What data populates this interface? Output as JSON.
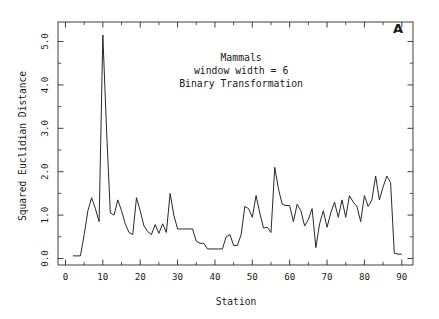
{
  "figure": {
    "panel_label": "A",
    "background_color": "#ffffff",
    "line_color": "#1c1c1c",
    "axis_color": "#2b2b2b"
  },
  "annotation": {
    "line1": "Mammals",
    "line2": "window width = 6",
    "line3": "Binary Transformation"
  },
  "chart_data": {
    "type": "line",
    "title": "",
    "subtitle": "",
    "xlabel": "Station",
    "ylabel": "Squared Euclidian Distance",
    "xlim": [
      -2,
      93
    ],
    "ylim": [
      -0.15,
      5.45
    ],
    "xticks": [
      0,
      10,
      20,
      30,
      40,
      50,
      60,
      70,
      80,
      90
    ],
    "xticklabels": [
      "0",
      "10",
      "20",
      "30",
      "40",
      "50",
      "60",
      "70",
      "80",
      "90"
    ],
    "x_minor_tick_step": 5,
    "yticks": [
      0.0,
      1.0,
      2.0,
      3.0,
      4.0,
      5.0
    ],
    "yticklabels": [
      "0.0",
      "1.0",
      "2.0",
      "3.0",
      "4.0",
      "5.0"
    ],
    "y_minor_tick_step": 0.5,
    "grid": false,
    "legend": false,
    "frame": "full-box",
    "annotations": [
      {
        "text": "Mammals",
        "x": 47,
        "y": 4.55
      },
      {
        "text": "window width = 6",
        "x": 47,
        "y": 4.25
      },
      {
        "text": "Binary Transformation",
        "x": 47,
        "y": 3.95
      },
      {
        "text": "A",
        "x": 89,
        "y": 5.2
      }
    ],
    "series": [
      {
        "name": "Squared Euclidian Distance",
        "x": [
          2,
          3,
          4,
          5,
          6,
          7,
          8,
          9,
          10,
          11,
          12,
          13,
          14,
          15,
          16,
          17,
          18,
          19,
          20,
          21,
          22,
          23,
          24,
          25,
          26,
          27,
          28,
          29,
          30,
          31,
          32,
          33,
          34,
          35,
          36,
          37,
          38,
          39,
          40,
          41,
          42,
          43,
          44,
          45,
          46,
          47,
          48,
          49,
          50,
          51,
          52,
          53,
          54,
          55,
          56,
          57,
          58,
          59,
          60,
          61,
          62,
          63,
          64,
          65,
          66,
          67,
          68,
          69,
          70,
          71,
          72,
          73,
          74,
          75,
          76,
          77,
          78,
          79,
          80,
          81,
          82,
          83,
          84,
          85,
          86,
          87,
          88,
          89,
          90
        ],
        "y": [
          0.06,
          0.06,
          0.06,
          0.55,
          1.1,
          1.4,
          1.15,
          0.85,
          5.15,
          2.95,
          1.05,
          1.0,
          1.35,
          1.1,
          0.8,
          0.6,
          0.55,
          1.4,
          1.1,
          0.75,
          0.62,
          0.55,
          0.78,
          0.58,
          0.8,
          0.6,
          1.5,
          1.0,
          0.68,
          0.68,
          0.68,
          0.68,
          0.68,
          0.4,
          0.35,
          0.35,
          0.22,
          0.22,
          0.22,
          0.22,
          0.22,
          0.5,
          0.55,
          0.3,
          0.3,
          0.55,
          1.2,
          1.15,
          0.95,
          1.45,
          1.05,
          0.7,
          0.72,
          0.6,
          2.1,
          1.6,
          1.25,
          1.22,
          1.22,
          0.85,
          1.25,
          1.1,
          0.75,
          0.9,
          1.15,
          0.25,
          0.8,
          1.1,
          0.72,
          1.05,
          1.3,
          0.95,
          1.35,
          0.95,
          1.45,
          1.3,
          1.2,
          0.85,
          1.45,
          1.2,
          1.35,
          1.9,
          1.35,
          1.65,
          1.9,
          1.75,
          0.12,
          0.1,
          0.1
        ]
      }
    ]
  }
}
